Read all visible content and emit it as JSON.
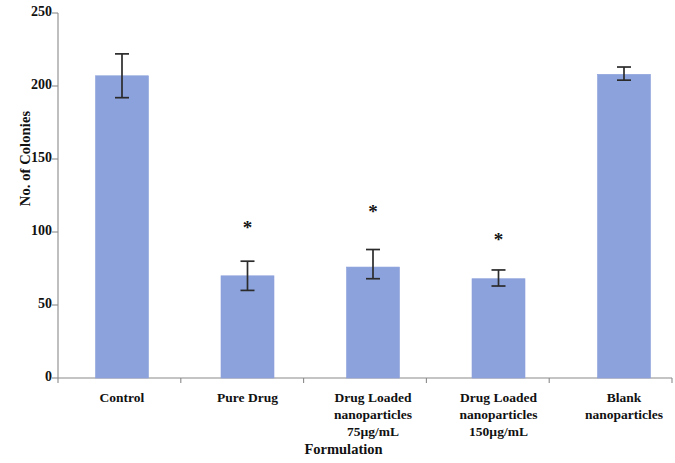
{
  "chart_data": {
    "type": "bar",
    "title": "",
    "xlabel": "Formulation",
    "ylabel": "No. of Colonies",
    "ylim": [
      0,
      250
    ],
    "yticks": [
      0,
      50,
      100,
      150,
      200,
      250
    ],
    "ytick_labels": [
      "0",
      "50",
      "100",
      "150",
      "200",
      "250"
    ],
    "grid": false,
    "legend": null,
    "bar_color": "#8CA2DC",
    "bar_edge_color": "#8CA2DC",
    "error_bar_color": "#2B2B2B",
    "axis_color": "#8A8A8A",
    "categories": [
      "Control",
      "Pure Drug",
      "Drug Loaded nanoparticles 75µg/mL",
      "Drug Loaded nanoparticles 150µg/mL",
      "Blank nanoparticles"
    ],
    "category_lines": [
      [
        "Control"
      ],
      [
        "Pure Drug"
      ],
      [
        "Drug Loaded",
        "nanoparticles",
        "75µg/mL"
      ],
      [
        "Drug Loaded",
        "nanoparticles",
        "150µg/mL"
      ],
      [
        "Blank",
        "nanoparticles"
      ]
    ],
    "values": [
      207,
      70,
      76,
      68,
      208
    ],
    "errors_upper": [
      15,
      10,
      12,
      6,
      5
    ],
    "errors_lower": [
      15,
      10,
      8,
      5,
      4
    ],
    "significance": [
      "",
      "*",
      "*",
      "*",
      ""
    ],
    "annotations": [
      {
        "label": "*",
        "category": "Pure Drug",
        "meaning": "significant vs control"
      },
      {
        "label": "*",
        "category": "Drug Loaded nanoparticles 75µg/mL",
        "meaning": "significant vs control"
      },
      {
        "label": "*",
        "category": "Drug Loaded nanoparticles 150µg/mL",
        "meaning": "significant vs control"
      }
    ]
  }
}
